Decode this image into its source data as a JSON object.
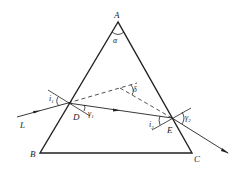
{
  "diagram": {
    "vertices": {
      "A": "A",
      "B": "B",
      "C": "C"
    },
    "points": {
      "D": "D",
      "E": "E"
    },
    "ray_label": "L",
    "angles": {
      "apex": "α",
      "deviation": "δ",
      "i1": "i",
      "i1_sub": "1",
      "r1": "γ",
      "r1_sub": "1",
      "i2": "i",
      "i2_sub": "2",
      "r2": "γ",
      "r2_sub": "2"
    },
    "colors": {
      "line": "#222222",
      "background": "#ffffff"
    }
  }
}
